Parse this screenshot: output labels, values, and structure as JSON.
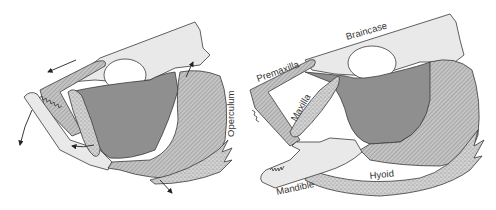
{
  "figure": {
    "colors": {
      "braincase": "#e9e9e9",
      "outline": "#3a3a3a",
      "muscle_dark": "#8f8f8f",
      "hatched": "#b8b8b8",
      "stipple": "#c9c9c9",
      "background": "#ffffff"
    },
    "panels": [
      {
        "id": "left",
        "state": "closed",
        "labels": {
          "operculum": "Operculum"
        },
        "arrows": [
          "premaxilla-forward-arrow",
          "mandible-down-arrow",
          "maxilla-rotate-arrow",
          "braincase-up-arrow",
          "hyoid-down-arrow"
        ]
      },
      {
        "id": "right",
        "state": "protruded",
        "labels": {
          "braincase": "Braincase",
          "premaxilla": "Premaxilla",
          "maxilla": "Maxilla",
          "mandible": "Mandible",
          "hyoid": "Hyoid"
        }
      }
    ]
  }
}
